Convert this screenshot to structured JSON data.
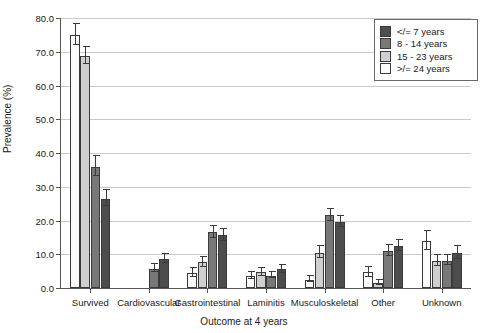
{
  "chart_data": {
    "type": "bar",
    "title": "",
    "xlabel": "Outcome at 4 years",
    "ylabel": "Prevalence (%)",
    "ylim": [
      0,
      80
    ],
    "ytick_step": 10,
    "ytick_labels": [
      "0.0",
      "10.0",
      "20.0",
      "30.0",
      "40.0",
      "50.0",
      "60.0",
      "70.0",
      "80.0"
    ],
    "grid": "horizontal",
    "legend_position": "top-right",
    "error_bars": "visible",
    "bar_order_note": "within each group bars are drawn in reverse legend order",
    "categories": [
      "Survived",
      "Cardiovascular",
      "Gastrointestinal",
      "Laminitis",
      "Musculoskeletal",
      "Other",
      "Unknown"
    ],
    "series": [
      {
        "name": "</= 7 years",
        "color": "#4d4d4d",
        "values": [
          26.5,
          8.6,
          15.6,
          5.5,
          19.5,
          12.4,
          10.4
        ],
        "err_low": [
          2.6,
          1.6,
          2.0,
          1.3,
          1.8,
          1.8,
          2.0
        ],
        "err_high": [
          2.6,
          1.6,
          2.0,
          1.3,
          1.8,
          1.8,
          2.0
        ]
      },
      {
        "name": "8 - 14 years",
        "color": "#787878",
        "values": [
          36.0,
          5.7,
          16.5,
          3.7,
          21.5,
          11.0,
          8.1
        ],
        "err_low": [
          3.2,
          1.3,
          1.9,
          1.0,
          2.0,
          1.8,
          1.6
        ],
        "err_high": [
          3.2,
          1.3,
          1.9,
          1.0,
          2.0,
          1.8,
          1.6
        ]
      },
      {
        "name": "15 - 23 years",
        "color": "#cfcfcf",
        "values": [
          68.8,
          0.0,
          7.6,
          4.6,
          10.5,
          1.6,
          8.0
        ],
        "err_low": [
          2.6,
          0.0,
          1.7,
          1.3,
          2.0,
          0.9,
          1.9
        ],
        "err_high": [
          2.6,
          0.0,
          1.7,
          1.3,
          2.0,
          0.9,
          1.9
        ]
      },
      {
        "name": ">/= 24 years",
        "color": "#fbfbfb",
        "values": [
          75.0,
          0.0,
          4.5,
          3.5,
          2.5,
          4.6,
          13.9
        ],
        "err_low": [
          3.2,
          0.0,
          1.5,
          1.2,
          1.0,
          1.7,
          3.0
        ],
        "err_high": [
          3.2,
          0.0,
          1.5,
          1.2,
          1.0,
          1.7,
          3.0
        ]
      }
    ]
  },
  "legend": {
    "items": [
      {
        "label": "</= 7 years",
        "color": "#4d4d4d"
      },
      {
        "label": "8 - 14 years",
        "color": "#787878"
      },
      {
        "label": "15 - 23 years",
        "color": "#cfcfcf"
      },
      {
        "label": ">/= 24 years",
        "color": "#fbfbfb"
      }
    ]
  }
}
